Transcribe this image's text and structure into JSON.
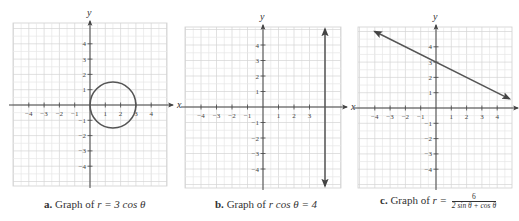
{
  "chart_data": [
    {
      "type": "line",
      "panel": "a",
      "title": "Graph of r = 3 cos θ",
      "caption": {
        "letter": "a.",
        "text": "Graph of ",
        "eq": "r = 3 cos θ"
      },
      "xlabel": "x",
      "ylabel": "y",
      "xlim": [
        -5,
        5
      ],
      "ylim": [
        -5,
        5
      ],
      "xticks": [
        -4,
        -3,
        -2,
        -1,
        1,
        2,
        3,
        4
      ],
      "yticks": [
        -4,
        -3,
        -2,
        -1,
        1,
        2,
        3,
        4
      ],
      "grid": true,
      "curve": {
        "shape": "circle",
        "center": [
          1.5,
          0
        ],
        "radius": 1.5,
        "color": "#555555"
      }
    },
    {
      "type": "line",
      "panel": "b",
      "title": "Graph of r cos θ = 4",
      "caption": {
        "letter": "b.",
        "text": "Graph of ",
        "eq": "r cos θ = 4"
      },
      "xlabel": "x",
      "ylabel": "y",
      "xlim": [
        -5,
        5
      ],
      "ylim": [
        -5,
        5
      ],
      "xticks": [
        -4,
        -3,
        -2,
        -1,
        1,
        2,
        3
      ],
      "yticks": [
        -4,
        -3,
        -2,
        -1,
        1,
        2,
        3,
        4
      ],
      "grid": true,
      "curve": {
        "shape": "vertical-line",
        "x": 4,
        "arrows": "both",
        "color": "#555555"
      }
    },
    {
      "type": "line",
      "panel": "c",
      "title": "Graph of r = 6 / (2 sin θ + cos θ)",
      "caption": {
        "letter": "c.",
        "text": "Graph of ",
        "eq_lhs": "r =",
        "numerator": "6",
        "denominator": "2 sin θ + cos θ"
      },
      "xlabel": "x",
      "ylabel": "y",
      "xlim": [
        -5,
        5
      ],
      "ylim": [
        -5,
        5
      ],
      "xticks": [
        -4,
        -3,
        -2,
        -1,
        1,
        2,
        3,
        4
      ],
      "yticks": [
        -4,
        -3,
        -2,
        -1,
        1,
        2,
        3,
        4
      ],
      "grid": true,
      "curve": {
        "shape": "line",
        "equation": "x + 2y = 6",
        "from": [
          -4,
          5
        ],
        "to": [
          4.8,
          0.6
        ],
        "y_intercept": 3,
        "arrows": "both",
        "color": "#555555"
      }
    }
  ],
  "panels": {
    "a": {
      "caption_letter": "a.",
      "caption_text": "Graph of ",
      "caption_eq": "r = 3 cos θ"
    },
    "b": {
      "caption_letter": "b.",
      "caption_text": "Graph of ",
      "caption_eq": "r cos θ = 4"
    },
    "c": {
      "caption_letter": "c.",
      "caption_text": "Graph of ",
      "caption_eq": "r =",
      "numerator": "6",
      "denominator": "2 sin θ + cos θ"
    }
  }
}
